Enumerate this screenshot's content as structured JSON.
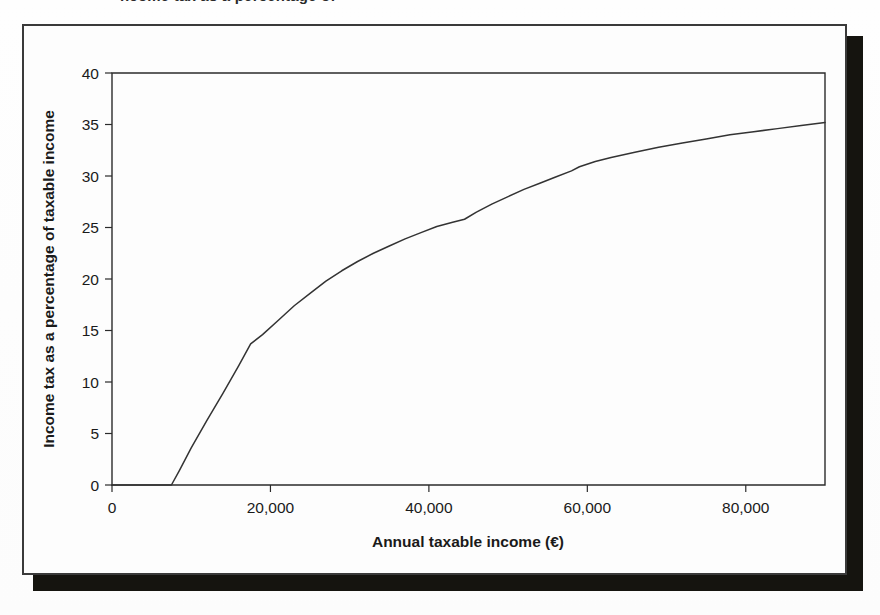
{
  "page": {
    "background_color": "#fdfdfd",
    "cropped_text_above_figure": "ncome tax as a percentage of"
  },
  "figure": {
    "frame_color": "#3a3a3a",
    "shadow_color": "#15140f",
    "plot_background": "#fdfdfd"
  },
  "chart_data": {
    "type": "line",
    "title": "",
    "subtitle": "",
    "xlabel": "Annual taxable income (€)",
    "ylabel": "Income tax as a percentage of taxable income",
    "xlim": [
      0,
      90000
    ],
    "ylim": [
      0,
      40
    ],
    "xticks": [
      0,
      20000,
      40000,
      60000,
      80000
    ],
    "xtick_labels": [
      "0",
      "20,000",
      "40,000",
      "60,000",
      "80,000"
    ],
    "yticks": [
      0,
      5,
      10,
      15,
      20,
      25,
      30,
      35,
      40
    ],
    "ytick_labels": [
      "0",
      "5",
      "10",
      "15",
      "20",
      "25",
      "30",
      "35",
      "40"
    ],
    "grid": false,
    "legend": false,
    "legend_position": "none",
    "line_color": "#333333",
    "line_width": 1.5,
    "series": [
      {
        "name": "Income tax as a percentage of taxable income",
        "x": [
          0,
          2000,
          4000,
          6000,
          7500,
          8500,
          10000,
          12000,
          14000,
          16000,
          17500,
          19000,
          21000,
          23000,
          25000,
          27000,
          29000,
          31000,
          33000,
          35000,
          37000,
          39000,
          41000,
          43000,
          44500,
          46000,
          48000,
          50000,
          52000,
          54000,
          56000,
          58000,
          59000,
          61000,
          63000,
          66000,
          69000,
          72000,
          75000,
          78000,
          81000,
          84000,
          87000,
          90000
        ],
        "y": [
          0,
          0,
          0,
          0,
          0,
          1.4,
          3.6,
          6.3,
          8.9,
          11.6,
          13.7,
          14.6,
          16.0,
          17.4,
          18.6,
          19.8,
          20.8,
          21.7,
          22.5,
          23.2,
          23.9,
          24.5,
          25.1,
          25.5,
          25.8,
          26.5,
          27.3,
          28.0,
          28.7,
          29.3,
          29.9,
          30.5,
          30.9,
          31.4,
          31.8,
          32.3,
          32.8,
          33.2,
          33.6,
          34.0,
          34.3,
          34.6,
          34.9,
          35.2
        ]
      }
    ],
    "annotations": [
      {
        "label": "tax-free threshold",
        "x": 7500,
        "y": 0
      },
      {
        "label": "first rate band kink",
        "x": 17500,
        "y": 13.7
      },
      {
        "label": "second band step",
        "x": 44500,
        "y": 25.8
      },
      {
        "label": "third band step",
        "x": 59000,
        "y": 30.9
      },
      {
        "label": "curve endpoint",
        "x": 90000,
        "y": 35.2
      }
    ]
  }
}
